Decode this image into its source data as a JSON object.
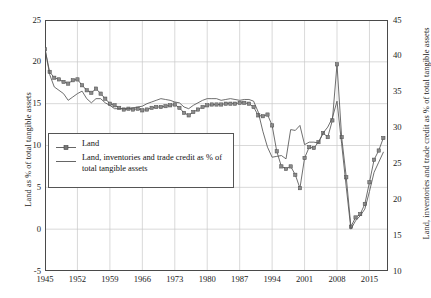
{
  "chart_data": {
    "type": "line",
    "title": "",
    "xlabel": "",
    "ylabel": "Land as % of total tangible assets",
    "ylabel_right": "Land, inventories and trade credit as % of total tangible assets",
    "xlim": [
      1945,
      2019
    ],
    "ylim": [
      -5,
      25
    ],
    "ylim_right": [
      10,
      45
    ],
    "grid": true,
    "legend_position": "center-left",
    "xticks": [
      1945,
      1952,
      1959,
      1966,
      1973,
      1980,
      1987,
      1994,
      2001,
      2008,
      2015
    ],
    "xtick_labels": [
      "1945",
      "1952",
      "1959",
      "1966",
      "1973",
      "1980",
      "1987",
      "1994",
      "2001",
      "2008",
      "2015"
    ],
    "yticks": [
      -5,
      0,
      5,
      10,
      15,
      20,
      25
    ],
    "ytick_labels": [
      "-5",
      "0",
      "5",
      "10",
      "15",
      "20",
      "25"
    ],
    "yticks_right": [
      10,
      15,
      20,
      25,
      30,
      35,
      40,
      45
    ],
    "ytick_labels_right": [
      "10",
      "15",
      "20",
      "25",
      "30",
      "35",
      "40",
      "45"
    ],
    "series": [
      {
        "name": "Land",
        "axis": "left",
        "marker": "square",
        "color": "#555555",
        "x": [
          1945,
          1946,
          1947,
          1948,
          1949,
          1950,
          1951,
          1952,
          1953,
          1954,
          1955,
          1956,
          1957,
          1958,
          1959,
          1960,
          1961,
          1962,
          1963,
          1964,
          1965,
          1966,
          1967,
          1968,
          1969,
          1970,
          1971,
          1972,
          1973,
          1974,
          1975,
          1976,
          1977,
          1978,
          1979,
          1980,
          1981,
          1982,
          1983,
          1984,
          1985,
          1986,
          1987,
          1988,
          1989,
          1990,
          1991,
          1992,
          1993,
          1994,
          1995,
          1996,
          1997,
          1998,
          1999,
          2000,
          2001,
          2002,
          2003,
          2004,
          2005,
          2006,
          2007,
          2008,
          2009,
          2010,
          2011,
          2012,
          2013,
          2014,
          2015,
          2016,
          2017,
          2018
        ],
        "values": [
          21.5,
          18.8,
          18.1,
          17.9,
          17.6,
          17.4,
          17.8,
          17.9,
          17.2,
          16.6,
          16.3,
          16.8,
          16.2,
          15.6,
          15.0,
          14.8,
          14.5,
          14.3,
          14.4,
          14.3,
          14.4,
          14.2,
          14.3,
          14.5,
          14.6,
          14.6,
          14.7,
          14.8,
          14.9,
          14.5,
          13.9,
          13.6,
          14.0,
          14.3,
          14.6,
          14.8,
          14.9,
          14.9,
          14.9,
          15.0,
          15.0,
          15.0,
          15.1,
          15.1,
          15.0,
          14.6,
          13.6,
          13.5,
          13.7,
          12.4,
          9.3,
          7.5,
          7.2,
          7.5,
          6.5,
          4.9,
          8.5,
          9.8,
          9.7,
          10.4,
          11.5,
          11.0,
          13.0,
          19.7,
          11.0,
          6.2,
          0.3,
          1.4,
          1.8,
          3.0,
          5.6,
          8.3,
          9.4,
          10.9
        ],
        "values_right_scale": [
          39.5,
          36.4,
          35.7,
          35.4,
          35.1,
          34.9,
          35.3,
          35.4,
          34.7,
          34.0,
          33.7,
          34.3,
          33.6,
          33.0,
          32.3,
          32.1,
          31.8,
          31.6,
          31.7,
          31.6,
          31.7,
          31.5,
          31.6,
          31.8,
          31.9,
          31.9,
          32.0,
          32.1,
          32.2,
          31.8,
          31.2,
          30.9,
          31.3,
          31.6,
          31.9,
          32.1,
          32.2,
          32.2,
          32.2,
          32.3,
          32.3,
          32.3,
          32.4,
          32.4,
          32.3,
          31.9,
          30.9,
          30.8,
          31.0,
          29.6,
          26.2,
          24.3,
          24.0,
          24.3,
          23.3,
          21.5,
          25.3,
          26.7,
          26.6,
          27.4,
          28.6,
          28.0,
          30.2,
          37.4,
          28.0,
          22.8,
          16.2,
          17.5,
          17.9,
          19.2,
          22.1,
          25.1,
          26.3,
          27.9
        ]
      },
      {
        "name": "Land, inventories and trade credit as % of total tangible assets",
        "axis": "right",
        "marker": "none",
        "color": "#555555",
        "x": [
          1945,
          1946,
          1947,
          1948,
          1949,
          1950,
          1951,
          1952,
          1953,
          1954,
          1955,
          1956,
          1957,
          1958,
          1959,
          1960,
          1961,
          1962,
          1963,
          1964,
          1965,
          1966,
          1967,
          1968,
          1969,
          1970,
          1971,
          1972,
          1973,
          1974,
          1975,
          1976,
          1977,
          1978,
          1979,
          1980,
          1981,
          1982,
          1983,
          1984,
          1985,
          1986,
          1987,
          1988,
          1989,
          1990,
          1991,
          1992,
          1993,
          1994,
          1995,
          1996,
          1997,
          1998,
          1999,
          2000,
          2001,
          2002,
          2003,
          2004,
          2005,
          2006,
          2007,
          2008,
          2009,
          2010,
          2011,
          2012,
          2013,
          2014,
          2015,
          2016,
          2017,
          2018
        ],
        "values_left_scale": [
          21.6,
          18.5,
          17.0,
          16.6,
          16.2,
          15.4,
          15.8,
          16.2,
          16.5,
          15.6,
          15.1,
          15.6,
          15.6,
          15.1,
          14.8,
          14.4,
          14.4,
          14.4,
          14.4,
          14.5,
          14.6,
          14.7,
          15.0,
          15.2,
          15.4,
          15.6,
          15.5,
          15.4,
          15.2,
          15.1,
          14.6,
          14.4,
          14.8,
          15.1,
          15.4,
          15.6,
          15.6,
          15.6,
          15.4,
          15.5,
          15.6,
          15.5,
          15.4,
          15.5,
          15.5,
          15.3,
          14.0,
          11.7,
          9.8,
          8.6,
          8.7,
          8.8,
          8.4,
          11.9,
          11.8,
          12.4,
          10.1,
          10.4,
          10.4,
          10.3,
          11.5,
          12.2,
          13.3,
          15.3,
          10.2,
          5.0,
          0.0,
          1.0,
          1.6,
          2.4,
          4.5,
          6.8,
          8.0,
          9.2
        ],
        "values": [
          40.2,
          36.3,
          34.8,
          34.4,
          33.9,
          33.1,
          33.5,
          33.9,
          34.3,
          33.3,
          32.7,
          33.2,
          33.2,
          32.7,
          32.3,
          31.9,
          31.9,
          31.9,
          31.9,
          32.0,
          32.1,
          32.2,
          32.5,
          32.7,
          33.0,
          33.2,
          33.1,
          33.0,
          32.7,
          32.6,
          32.1,
          31.9,
          32.3,
          32.6,
          33.0,
          33.2,
          33.2,
          33.2,
          33.0,
          33.1,
          33.2,
          33.1,
          33.0,
          33.1,
          33.1,
          32.9,
          31.5,
          28.8,
          26.7,
          25.3,
          25.4,
          25.5,
          25.1,
          29.1,
          29.0,
          29.7,
          27.1,
          27.4,
          27.4,
          27.3,
          28.6,
          29.4,
          30.7,
          33.0,
          27.1,
          21.5,
          15.8,
          16.9,
          17.6,
          18.5,
          20.9,
          23.6,
          25.0,
          26.4
        ]
      }
    ]
  },
  "legend": {
    "items": [
      {
        "label": "Land",
        "style": "marker-line"
      },
      {
        "label": "Land, inventories and trade credit as % of total tangible assets",
        "style": "line"
      }
    ]
  }
}
